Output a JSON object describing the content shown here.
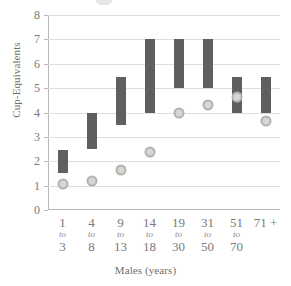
{
  "chart_data": {
    "type": "bar",
    "title": "",
    "xlabel": "Males (years)",
    "ylabel": "Cup-Equivalents",
    "ylim": [
      0,
      8
    ],
    "ytick_step": 1,
    "yticks": [
      "8",
      "7",
      "6",
      "5",
      "4",
      "3",
      "2",
      "1",
      "0"
    ],
    "grid": true,
    "legend": "none",
    "categories": [
      "1 to 3",
      "4 to 8",
      "9 to 13",
      "14 to 18",
      "19 to 30",
      "31 to 50",
      "51 to 70",
      "71 +"
    ],
    "category_labels": [
      {
        "from": "1",
        "word": "to",
        "to": "3"
      },
      {
        "from": "4",
        "word": "to",
        "to": "8"
      },
      {
        "from": "9",
        "word": "to",
        "to": "13"
      },
      {
        "from": "14",
        "word": "to",
        "to": "18"
      },
      {
        "from": "19",
        "word": "to",
        "to": "30"
      },
      {
        "from": "31",
        "word": "to",
        "to": "50"
      },
      {
        "from": "51",
        "word": "to",
        "to": "70"
      },
      {
        "from": "71 +",
        "word": "",
        "to": ""
      }
    ],
    "series": [
      {
        "name": "Recommended intake range",
        "type": "range-bar",
        "color": "#5f5f5f",
        "low": [
          1.5,
          2.5,
          3.5,
          4.0,
          5.0,
          5.0,
          4.0,
          4.0
        ],
        "high": [
          2.45,
          4.0,
          5.45,
          7.0,
          7.0,
          7.0,
          5.45,
          5.45
        ]
      },
      {
        "name": "Average intake",
        "type": "marker",
        "color": "#d6d6d2",
        "edge_color": "#b2b2ae",
        "values": [
          1.05,
          1.2,
          1.65,
          2.4,
          4.0,
          4.3,
          4.65,
          3.65
        ]
      }
    ]
  }
}
